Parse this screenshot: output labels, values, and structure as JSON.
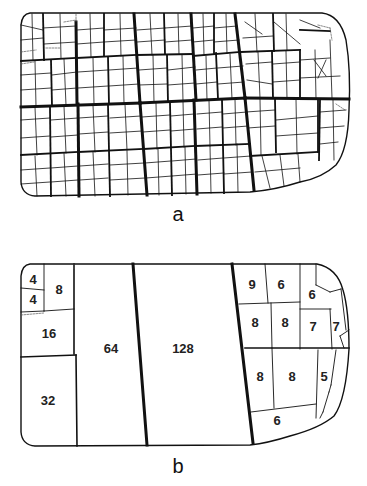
{
  "figure": {
    "panels": [
      {
        "id": "a",
        "label": "a",
        "description": "Original field subdivided into many small irregular parcels, grouped by thick boundary lines into larger blocks"
      },
      {
        "id": "b",
        "label": "b",
        "description": "Consolidated parcels with area values",
        "parcels": [
          {
            "value": "4",
            "x": 33,
            "y": 281
          },
          {
            "value": "4",
            "x": 33,
            "y": 301
          },
          {
            "value": "8",
            "x": 59,
            "y": 291
          },
          {
            "value": "16",
            "x": 49,
            "y": 335
          },
          {
            "value": "32",
            "x": 48,
            "y": 402
          },
          {
            "value": "64",
            "x": 111,
            "y": 350
          },
          {
            "value": "128",
            "x": 183,
            "y": 350
          },
          {
            "value": "9",
            "x": 252,
            "y": 286
          },
          {
            "value": "6",
            "x": 281,
            "y": 286
          },
          {
            "value": "6",
            "x": 312,
            "y": 296
          },
          {
            "value": "8",
            "x": 255,
            "y": 324
          },
          {
            "value": "8",
            "x": 285,
            "y": 324
          },
          {
            "value": "7",
            "x": 313,
            "y": 328
          },
          {
            "value": "7",
            "x": 336,
            "y": 328
          },
          {
            "value": "8",
            "x": 260,
            "y": 378
          },
          {
            "value": "8",
            "x": 292,
            "y": 378
          },
          {
            "value": "5",
            "x": 324,
            "y": 378
          },
          {
            "value": "6",
            "x": 277,
            "y": 422
          }
        ]
      }
    ],
    "colors": {
      "line": "#111111",
      "background": "#ffffff"
    }
  }
}
